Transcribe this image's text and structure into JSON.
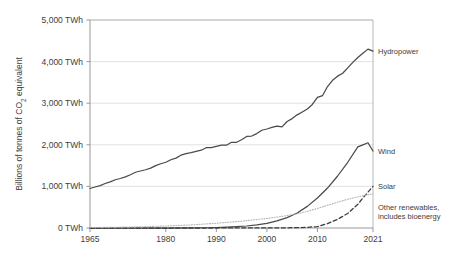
{
  "chart_data": {
    "type": "line",
    "title": "",
    "xlabel": "",
    "ylabel": "Billions of tonnes of CO2 equivalent",
    "ylabel_display": "Billions of tonnes of CO",
    "ylabel_sub": "2",
    "ylabel_tail": " equivalent",
    "xlim": [
      1965,
      2021
    ],
    "ylim": [
      0,
      5000
    ],
    "grid": true,
    "legend_position": "right-inline-labels",
    "yticks": [
      0,
      1000,
      2000,
      3000,
      4000,
      5000
    ],
    "ytick_labels": [
      "0 TWh",
      "1,000 TWh",
      "2,000 TWh",
      "3,000 TWh",
      "4,000 TWh",
      "5,000 TWh"
    ],
    "xticks": [
      1965,
      1980,
      1990,
      2000,
      2010,
      2021
    ],
    "xtick_labels": [
      "1965",
      "1980",
      "1990",
      "2000",
      "2010",
      "2021"
    ],
    "series": [
      {
        "name": "Hydropower",
        "style": "solid",
        "color": "#4a4a4a",
        "label_year": 2021,
        "label_value": 4250,
        "x": [
          1965,
          1966,
          1967,
          1968,
          1969,
          1970,
          1971,
          1972,
          1973,
          1974,
          1975,
          1976,
          1977,
          1978,
          1979,
          1980,
          1981,
          1982,
          1983,
          1984,
          1985,
          1986,
          1987,
          1988,
          1989,
          1990,
          1991,
          1992,
          1993,
          1994,
          1995,
          1996,
          1997,
          1998,
          1999,
          2000,
          2001,
          2002,
          2003,
          2004,
          2005,
          2006,
          2007,
          2008,
          2009,
          2010,
          2011,
          2012,
          2013,
          2014,
          2015,
          2016,
          2017,
          2018,
          2019,
          2020,
          2021
        ],
        "values": [
          950,
          985,
          1020,
          1070,
          1110,
          1160,
          1190,
          1230,
          1280,
          1340,
          1370,
          1400,
          1440,
          1500,
          1545,
          1580,
          1640,
          1680,
          1750,
          1790,
          1810,
          1840,
          1870,
          1930,
          1930,
          1960,
          1990,
          1990,
          2060,
          2060,
          2120,
          2200,
          2210,
          2270,
          2350,
          2380,
          2420,
          2450,
          2430,
          2560,
          2630,
          2720,
          2790,
          2860,
          2970,
          3140,
          3180,
          3400,
          3550,
          3650,
          3720,
          3850,
          3980,
          4100,
          4200,
          4300,
          4250
        ]
      },
      {
        "name": "Wind",
        "style": "solid",
        "color": "#4a4a4a",
        "label_year": 2021,
        "label_value": 1850,
        "x": [
          1965,
          1970,
          1975,
          1980,
          1983,
          1985,
          1988,
          1990,
          1992,
          1994,
          1996,
          1998,
          2000,
          2002,
          2004,
          2006,
          2008,
          2010,
          2012,
          2014,
          2016,
          2018,
          2019,
          2020,
          2021
        ],
        "values": [
          0,
          0,
          0,
          0,
          1,
          3,
          6,
          12,
          20,
          32,
          48,
          75,
          110,
          170,
          250,
          360,
          520,
          720,
          960,
          1250,
          1580,
          1950,
          2000,
          2050,
          1850
        ]
      },
      {
        "name": "Solar",
        "style": "dashed",
        "color": "#3a3a3a",
        "label_year": 2021,
        "label_value": 1000,
        "x": [
          1965,
          1975,
          1985,
          1990,
          1995,
          2000,
          2004,
          2006,
          2008,
          2010,
          2012,
          2014,
          2016,
          2018,
          2019,
          2020,
          2021
        ],
        "values": [
          0,
          0,
          0,
          0,
          1,
          2,
          5,
          9,
          16,
          35,
          105,
          210,
          350,
          570,
          720,
          860,
          1000
        ]
      },
      {
        "name": "Other renewables, includes bioenergy",
        "name_line1": "Other renewables,",
        "name_line2": "includes bioenergy",
        "style": "dotted",
        "color": "#b5b5b5",
        "label_year": 2021,
        "label_value": 820,
        "x": [
          1965,
          1970,
          1975,
          1980,
          1985,
          1990,
          1995,
          2000,
          2003,
          2006,
          2008,
          2010,
          2012,
          2014,
          2016,
          2018,
          2020,
          2021
        ],
        "values": [
          10,
          18,
          30,
          48,
          75,
          115,
          165,
          230,
          280,
          340,
          400,
          470,
          545,
          620,
          690,
          750,
          800,
          820
        ]
      }
    ],
    "colors": {
      "grid": "#d9d9d9",
      "axis": "#8c8c8c",
      "text": "#3d3d3d",
      "background": "#ffffff"
    }
  }
}
